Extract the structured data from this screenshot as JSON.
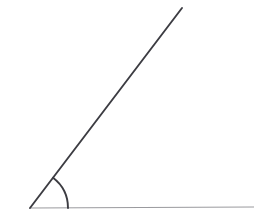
{
  "figure": {
    "name": "acute-angle-diagram",
    "title": "",
    "width": 254,
    "height": 211,
    "background_color": "#ffffff",
    "labels": [],
    "vertex": {
      "x": 30,
      "y": 208
    },
    "rays": [
      {
        "name": "horizontal-ray",
        "from": {
          "x": 30,
          "y": 208
        },
        "to": {
          "x": 254,
          "y": 207
        },
        "color": "#9a9a9e",
        "width": 1.1
      },
      {
        "name": "diagonal-ray",
        "from": {
          "x": 30,
          "y": 208
        },
        "to": {
          "x": 182,
          "y": 8
        },
        "color": "#3c3c42",
        "width": 1.9
      }
    ],
    "arc": {
      "name": "angle-arc",
      "center": {
        "x": 30,
        "y": 208
      },
      "radius": 38,
      "start_angle_deg": 0,
      "end_angle_deg": 52.7,
      "color": "#3c3c42",
      "width": 1.9,
      "path": "M 68 208 A 38 38 0 0 0 53.0 177.8"
    }
  }
}
